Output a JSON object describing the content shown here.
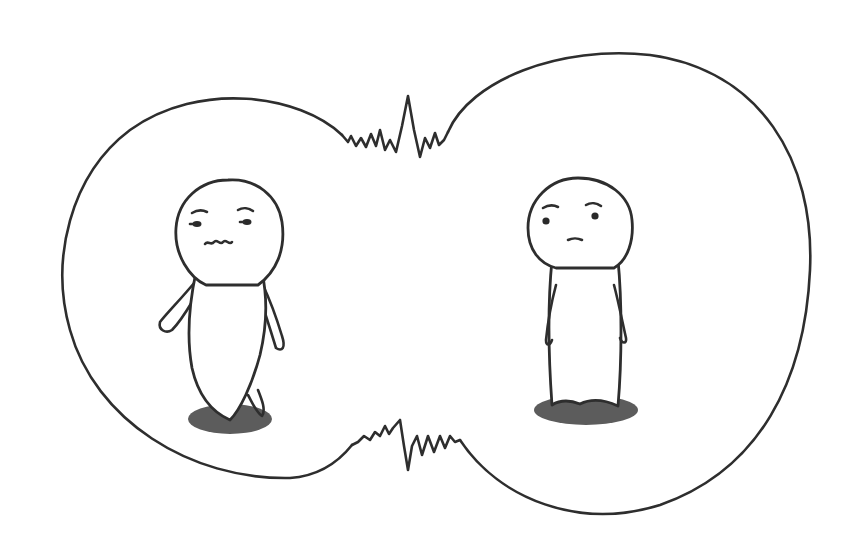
{
  "illustration": {
    "description": "Two simple cartoon figures each inside a bubble; the bubbles merge in the middle with jagged, zig-zag connecting lines",
    "colors": {
      "background": "#ffffff",
      "line": "#2e2e2e",
      "shadow": "#5c5c5c"
    },
    "figures": [
      {
        "id": "left",
        "expression": "uneasy, wavy mouth, side-glancing eyes",
        "pose": "leaning, walking"
      },
      {
        "id": "right",
        "expression": "neutral, small mouth, glancing",
        "pose": "standing straight"
      }
    ],
    "connection": "jagged zig-zag lines at top and bottom where the two bubbles meet"
  }
}
